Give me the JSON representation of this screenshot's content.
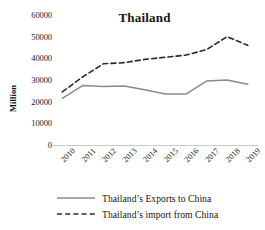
{
  "chart_data": {
    "type": "line",
    "title": "Thailand",
    "xlabel": "",
    "ylabel": "Million",
    "categories": [
      "2010",
      "2011",
      "2012",
      "2013",
      "2014",
      "2015",
      "2016",
      "2017",
      "2018",
      "2019"
    ],
    "ylim": [
      0,
      60000
    ],
    "yticks": [
      "60000",
      "50000",
      "40000",
      "30000",
      "20000",
      "10000",
      "0"
    ],
    "ytick_values": [
      60000,
      50000,
      40000,
      30000,
      20000,
      10000,
      0
    ],
    "grid": false,
    "legend_position": "bottom",
    "series": [
      {
        "name": "Thailand’s Exports to China",
        "style": "solid",
        "color": "#8a8a8a",
        "values": [
          21500,
          27500,
          27000,
          27200,
          25500,
          23500,
          23500,
          29500,
          30000,
          28000
        ]
      },
      {
        "name": "Thailand’s import from China",
        "style": "dashed",
        "color": "#2b2b2b",
        "values": [
          24500,
          31500,
          37500,
          38000,
          39500,
          40500,
          41500,
          44000,
          50000,
          46000
        ]
      }
    ]
  },
  "legend": {
    "items": [
      {
        "label": "Thailand’s Exports to China"
      },
      {
        "label": "Thailand’s import from China"
      }
    ]
  },
  "colors": {
    "exports_line": "#8a8a8a",
    "imports_line": "#2b2b2b",
    "axis": "#c9c9c9",
    "text": "#161616"
  }
}
